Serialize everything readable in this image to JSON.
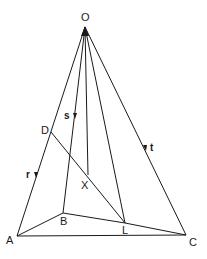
{
  "diagram": {
    "points": {
      "O": {
        "label": "O",
        "x": 85,
        "y": 27
      },
      "A": {
        "label": "A",
        "x": 17,
        "y": 236
      },
      "B": {
        "label": "B",
        "x": 63,
        "y": 213
      },
      "C": {
        "label": "C",
        "x": 186,
        "y": 235
      },
      "L": {
        "label": "L",
        "x": 125,
        "y": 223
      },
      "D": {
        "label": "D",
        "x": 51,
        "y": 132
      },
      "X": {
        "label": "X",
        "x": 88,
        "y": 175
      }
    },
    "vectors": {
      "r": {
        "label": "r"
      },
      "s": {
        "label": "s"
      },
      "t": {
        "label": "t"
      }
    },
    "edges": [
      "O-A",
      "O-B",
      "O-X",
      "O-L",
      "O-C",
      "A-B",
      "B-L",
      "L-C",
      "A-C",
      "D-L"
    ]
  }
}
